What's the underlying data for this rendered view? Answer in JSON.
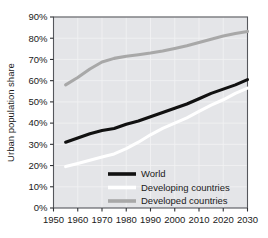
{
  "chart_data": {
    "type": "line",
    "title": "",
    "xlabel": "",
    "ylabel": "Urban population share",
    "xlim": [
      1950,
      2030
    ],
    "ylim": [
      0,
      90
    ],
    "grid": true,
    "legend_position": "bottom-right-inside",
    "x_ticks": [
      "1950",
      "1960",
      "1970",
      "1980",
      "1990",
      "2000",
      "2010",
      "2020",
      "2030"
    ],
    "y_ticks": [
      "0%",
      "10%",
      "20%",
      "30%",
      "40%",
      "50%",
      "60%",
      "70%",
      "80%",
      "90%"
    ],
    "plot_background": "#e4e5e8",
    "series": [
      {
        "name": "World",
        "color": "#111111",
        "x": [
          1955,
          1960,
          1965,
          1970,
          1975,
          1980,
          1985,
          1990,
          1995,
          2000,
          2005,
          2010,
          2015,
          2020,
          2025,
          2030
        ],
        "values": [
          31,
          33,
          35,
          36.5,
          37.5,
          39.5,
          41,
          43,
          45,
          47,
          49,
          51.5,
          54,
          56,
          58,
          60.5
        ]
      },
      {
        "name": "Developing countries",
        "color": "#ffffff",
        "x": [
          1955,
          1960,
          1965,
          1970,
          1975,
          1980,
          1985,
          1990,
          1995,
          2000,
          2005,
          2010,
          2015,
          2020,
          2025,
          2030
        ],
        "values": [
          19.5,
          21,
          22.5,
          24,
          25.5,
          28,
          31,
          34.5,
          37.5,
          40,
          42.5,
          45.5,
          48.5,
          51,
          54,
          56.5
        ]
      },
      {
        "name": "Developed countries",
        "color": "#a8a8a8",
        "x": [
          1955,
          1960,
          1965,
          1970,
          1975,
          1980,
          1985,
          1990,
          1995,
          2000,
          2005,
          2010,
          2015,
          2020,
          2025,
          2030
        ],
        "values": [
          58,
          61.5,
          65.5,
          68.8,
          70.5,
          71.5,
          72.2,
          73,
          74,
          75.2,
          76.5,
          78,
          79.5,
          81,
          82.2,
          83.2
        ]
      }
    ]
  },
  "legend": {
    "items": [
      {
        "label": "World",
        "color": "#111111"
      },
      {
        "label": "Developing countries",
        "color": "#ffffff"
      },
      {
        "label": "Developed countries",
        "color": "#a8a8a8"
      }
    ]
  }
}
